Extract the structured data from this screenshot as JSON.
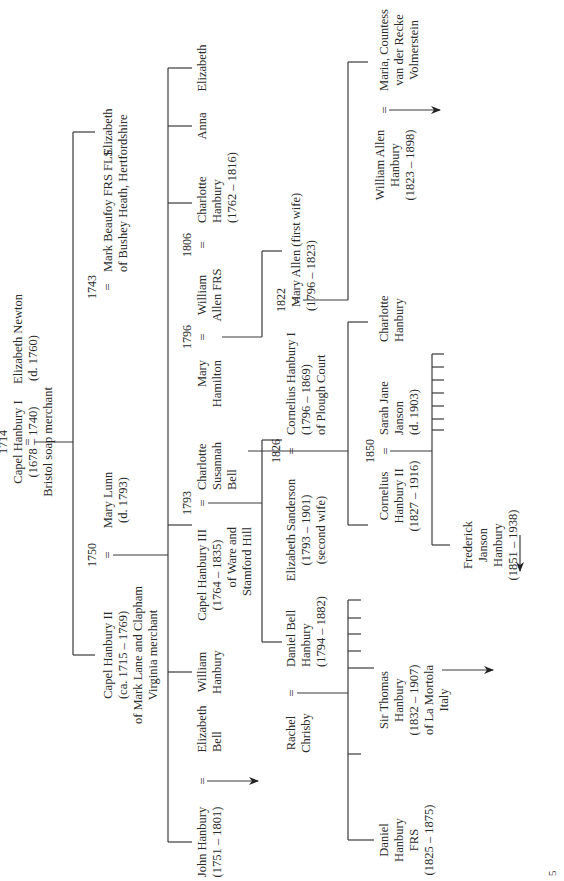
{
  "diagram": {
    "orientation": "rotated-90-ccw",
    "marriage_symbol": "=",
    "page_mark": "5",
    "people": {
      "capel1": [
        "Capel Hanbury I",
        "(1678 – 1740)",
        "Bristol soap merchant"
      ],
      "eliz_newton": [
        "Elizabeth Newton",
        "(d. 1760)"
      ],
      "capel2": [
        "Capel Hanbury II",
        "(ca. 1715 – 1769)",
        "of Mark Lane and Clapham",
        "Virginia merchant"
      ],
      "mary_lunn": [
        "Mary Lunn",
        "(d. 1793)"
      ],
      "eliz_gen1": [
        "Elizabeth"
      ],
      "mark_beaufoy": [
        "Mark Beaufoy FRS FLS",
        "of Bushey Heath, Hertfordshire"
      ],
      "john_hanbury": [
        "John Hanbury",
        "(1751 – 1801)"
      ],
      "eliz_bell": [
        "Elizabeth",
        "Bell"
      ],
      "william_hanbury": [
        "William",
        "Hanbury"
      ],
      "capel3": [
        "Capel Hanbury III",
        "(1764 – 1835)",
        "of Ware and",
        "Stamford Hill"
      ],
      "charlotte_bell": [
        "Charlotte",
        "Susannah",
        "Bell"
      ],
      "mary_hamilton": [
        "Mary",
        "Hamilton"
      ],
      "william_allen": [
        "William",
        "Allen FRS"
      ],
      "charlotte_h1": [
        "Charlotte",
        "Hanbury",
        "(1762 – 1816)"
      ],
      "anna": [
        "Anna"
      ],
      "eliz_gen2": [
        "Elizabeth"
      ],
      "daniel_bell": [
        "Daniel Bell",
        "Hanbury",
        "(1794 – 1882)"
      ],
      "rachel": [
        "Rachel",
        "Chrisby"
      ],
      "eliz_sanderson": [
        "Elizabeth Sanderson",
        "(1793 – 1901)",
        "(second wife)"
      ],
      "cornelius1": [
        "Cornelius Hanbury I",
        "(1796 – 1869)",
        "of Plough Court"
      ],
      "mary_allen": [
        "Mary Allen (first wife)",
        "(1796 – 1823)"
      ],
      "william_allen_h": [
        "William Allen",
        "Hanbury",
        "(1823 – 1898)"
      ],
      "maria": [
        "Maria, Countess",
        "van der Recke",
        "Volmerstein"
      ],
      "cornelius2": [
        "Cornelius",
        "Hanbury II",
        "(1827 – 1916)"
      ],
      "sarah_jane": [
        "Sarah Jane",
        "Janson",
        "(d. 1903)"
      ],
      "charlotte_h2": [
        "Charlotte",
        "Hanbury"
      ],
      "frederick": [
        "Frederick",
        "Janson",
        "Hanbury",
        "(1851 – 1938)"
      ],
      "daniel_frs": [
        "Daniel",
        "Hanbury",
        "FRS",
        "(1825 – 1875)"
      ],
      "thomas": [
        "Sir Thomas",
        "Hanbury",
        "(1832 – 1907)",
        "of La Mortola",
        "Italy"
      ]
    },
    "marriage_years": {
      "m1714": "1714",
      "m1743": "1743",
      "m1750": "1750",
      "m1793": "1793",
      "m1796": "1796",
      "m1806": "1806",
      "m1822": "1822",
      "m1826": "1826",
      "m1850": "1850"
    }
  }
}
